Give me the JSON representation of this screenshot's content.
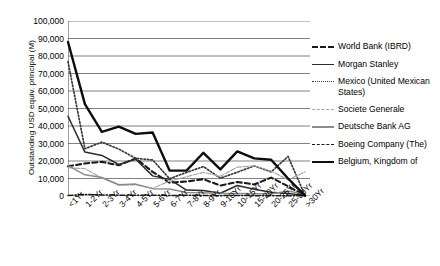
{
  "chart_data": {
    "type": "line",
    "title": "",
    "xlabel": "",
    "ylabel": "Outstanding USD equiv. principal (M)",
    "ylim": [
      0,
      100000
    ],
    "yticks": [
      "0",
      "10,000",
      "20,000",
      "30,000",
      "40,000",
      "50,000",
      "60,000",
      "70,000",
      "80,000",
      "90,000",
      "100,000"
    ],
    "grid": true,
    "legend_position": "right",
    "categories": [
      "<1Yr",
      "1-2Yr",
      "2-3Yr",
      "3-4Yr",
      "4-5Yr",
      "5-6Yr",
      "6-7Yr",
      "7-8Yr",
      "8-9Yr",
      "9-10Yr",
      "10-15Yr",
      "15-20Yr",
      "20-25Yr",
      "25-30Yr",
      ">30Yr"
    ],
    "series": [
      {
        "name": "World Bank (IBRD)",
        "style": "dashed",
        "color": "#1a1a1a",
        "width": 2.1,
        "values": [
          17000,
          18600,
          19500,
          17600,
          21500,
          13800,
          7600,
          8300,
          9600,
          6000,
          8000,
          6600,
          10500,
          5600,
          200
        ]
      },
      {
        "name": "Morgan Stanley",
        "style": "solid",
        "color": "#2b2b2b",
        "width": 1.5,
        "values": [
          45600,
          25100,
          23200,
          18000,
          21000,
          11500,
          9500,
          3400,
          3200,
          1600,
          6000,
          3800,
          2100,
          1400,
          300
        ]
      },
      {
        "name": "Mexico (United Mexican States)",
        "style": "dotted",
        "color": "#3a3a3a",
        "width": 1.7,
        "values": [
          76800,
          27000,
          30800,
          26800,
          21500,
          20600,
          9900,
          13500,
          16800,
          10200,
          13600,
          17200,
          13800,
          22600,
          300
        ]
      },
      {
        "name": "Societe Generale",
        "style": "thin-light",
        "color": "#a8a8a8",
        "width": 1.2,
        "values": [
          16200,
          15600,
          10300,
          6200,
          6400,
          4300,
          8600,
          11000,
          13500,
          11300,
          16500,
          17200,
          14200,
          9200,
          13800
        ]
      },
      {
        "name": "Deutsche Bank AG",
        "style": "solid-gray",
        "color": "#8c8c8c",
        "width": 1.5,
        "values": [
          17400,
          12100,
          10600,
          6400,
          6800,
          4200,
          4000,
          2000,
          1800,
          1500,
          1500,
          1300,
          1200,
          2900,
          1000
        ]
      },
      {
        "name": "Boeing Company (The)",
        "style": "dash-dot",
        "color": "#1a1a1a",
        "width": 1.5,
        "values": [
          300,
          900,
          600,
          500,
          400,
          500,
          300,
          400,
          300,
          200,
          300,
          200,
          200,
          200,
          100
        ]
      },
      {
        "name": "Belgium, Kingdom of",
        "style": "solid-bold",
        "color": "#0d0d0d",
        "width": 2.4,
        "values": [
          88000,
          52500,
          36700,
          39600,
          35500,
          36300,
          14600,
          14500,
          24700,
          15200,
          25500,
          21500,
          20700,
          10000,
          200
        ]
      }
    ]
  }
}
